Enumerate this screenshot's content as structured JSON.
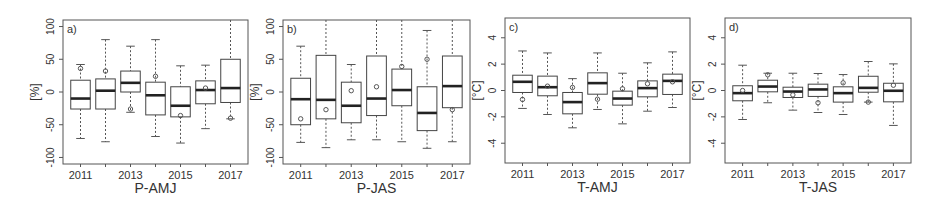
{
  "chart_data": [
    {
      "type": "box",
      "panel": "a)",
      "title": "",
      "xlabel": "P-AMJ",
      "ylabel": "[%]",
      "ylim": [
        -110,
        110
      ],
      "yticks": [
        100,
        50,
        0,
        -50,
        -100
      ],
      "xtick_labels": [
        "2011",
        "2013",
        "2015",
        "2017"
      ],
      "categories": [
        "2011",
        "2012",
        "2013",
        "2014",
        "2015",
        "2016",
        "2017"
      ],
      "grid": false,
      "boxes": [
        {
          "year": "2011",
          "whisker_low": -71,
          "q1": -26,
          "median": -10,
          "q3": 18,
          "whisker_high": 42,
          "mean": 36
        },
        {
          "year": "2012",
          "whisker_low": -76,
          "q1": -26,
          "median": 2,
          "q3": 20,
          "whisker_high": 80,
          "mean": 32
        },
        {
          "year": "2013",
          "whisker_low": -31,
          "q1": 0,
          "median": 14,
          "q3": 32,
          "whisker_high": 70,
          "mean": -26
        },
        {
          "year": "2014",
          "whisker_low": -68,
          "q1": -35,
          "median": -5,
          "q3": 15,
          "whisker_high": 80,
          "mean": 24
        },
        {
          "year": "2015",
          "whisker_low": -78,
          "q1": -38,
          "median": -21,
          "q3": 8,
          "whisker_high": 40,
          "mean": -36
        },
        {
          "year": "2016",
          "whisker_low": -56,
          "q1": -18,
          "median": 3,
          "q3": 17,
          "whisker_high": 41,
          "mean": 6
        },
        {
          "year": "2017",
          "whisker_low": -41,
          "q1": -16,
          "median": 6,
          "q3": 50,
          "whisker_high": 110,
          "mean": -40
        }
      ]
    },
    {
      "type": "box",
      "panel": "b)",
      "title": "",
      "xlabel": "P-JAS",
      "ylabel": "[%]",
      "ylim": [
        -110,
        110
      ],
      "yticks": [
        100,
        50,
        0,
        -50,
        -100
      ],
      "xtick_labels": [
        "2011",
        "2013",
        "2015",
        "2017"
      ],
      "categories": [
        "2011",
        "2012",
        "2013",
        "2014",
        "2015",
        "2016",
        "2017"
      ],
      "grid": false,
      "boxes": [
        {
          "year": "2011",
          "whisker_low": -77,
          "q1": -50,
          "median": -11,
          "q3": 21,
          "whisker_high": 70,
          "mean": -41
        },
        {
          "year": "2012",
          "whisker_low": -85,
          "q1": -41,
          "median": -12,
          "q3": 56,
          "whisker_high": 110,
          "mean": -27
        },
        {
          "year": "2013",
          "whisker_low": -73,
          "q1": -47,
          "median": -21,
          "q3": 15,
          "whisker_high": 42,
          "mean": 2
        },
        {
          "year": "2014",
          "whisker_low": -73,
          "q1": -36,
          "median": -10,
          "q3": 55,
          "whisker_high": 110,
          "mean": 8
        },
        {
          "year": "2015",
          "whisker_low": -76,
          "q1": -21,
          "median": 3,
          "q3": 35,
          "whisker_high": 110,
          "mean": 39
        },
        {
          "year": "2016",
          "whisker_low": -86,
          "q1": -59,
          "median": -32,
          "q3": 8,
          "whisker_high": 94,
          "mean": 50
        },
        {
          "year": "2017",
          "whisker_low": -76,
          "q1": -24,
          "median": 9,
          "q3": 55,
          "whisker_high": 110,
          "mean": -27
        }
      ]
    },
    {
      "type": "box",
      "panel": "c)",
      "title": "",
      "xlabel": "T-AMJ",
      "ylabel": "[°C]",
      "ylim": [
        -5.5,
        5.5
      ],
      "yticks": [
        4,
        2,
        0,
        -2,
        -4
      ],
      "xtick_labels": [
        "2011",
        "2013",
        "2015",
        "2017"
      ],
      "categories": [
        "2011",
        "2012",
        "2013",
        "2014",
        "2015",
        "2016",
        "2017"
      ],
      "grid": false,
      "boxes": [
        {
          "year": "2011",
          "whisker_low": -1.36,
          "q1": -0.15,
          "median": 0.66,
          "q3": 1.16,
          "whisker_high": 3.0,
          "mean": -0.68
        },
        {
          "year": "2012",
          "whisker_low": -1.82,
          "q1": -0.4,
          "median": 0.25,
          "q3": 1.09,
          "whisker_high": 2.85,
          "mean": 0.33
        },
        {
          "year": "2013",
          "whisker_low": -2.83,
          "q1": -1.77,
          "median": -0.88,
          "q3": -0.15,
          "whisker_high": 0.9,
          "mean": 0.23
        },
        {
          "year": "2014",
          "whisker_low": -1.44,
          "q1": -0.28,
          "median": 0.56,
          "q3": 1.34,
          "whisker_high": 2.85,
          "mean": -0.66
        },
        {
          "year": "2015",
          "whisker_low": -2.53,
          "q1": -1.11,
          "median": -0.61,
          "q3": -0.05,
          "whisker_high": 1.31,
          "mean": 0.13
        },
        {
          "year": "2016",
          "whisker_low": -1.57,
          "q1": -0.48,
          "median": 0.18,
          "q3": 0.73,
          "whisker_high": 2.1,
          "mean": 0.51
        },
        {
          "year": "2017",
          "whisker_low": -1.29,
          "q1": -0.3,
          "median": 0.73,
          "q3": 1.24,
          "whisker_high": 2.93,
          "mean": 0.66
        }
      ]
    },
    {
      "type": "box",
      "panel": "d)",
      "title": "",
      "xlabel": "T-JAS",
      "ylabel": "[°C]",
      "ylim": [
        -5.5,
        5.5
      ],
      "yticks": [
        4,
        2,
        0,
        -2,
        -4
      ],
      "xtick_labels": [
        "2011",
        "2013",
        "2015",
        "2017"
      ],
      "categories": [
        "2011",
        "2012",
        "2013",
        "2014",
        "2015",
        "2016",
        "2017"
      ],
      "grid": false,
      "boxes": [
        {
          "year": "2011",
          "whisker_low": -2.2,
          "q1": -0.78,
          "median": -0.2,
          "q3": 0.36,
          "whisker_high": 1.92,
          "mean": 0.0
        },
        {
          "year": "2012",
          "whisker_low": -0.93,
          "q1": -0.1,
          "median": 0.3,
          "q3": 0.78,
          "whisker_high": 1.31,
          "mean": 1.19
        },
        {
          "year": "2013",
          "whisker_low": -1.49,
          "q1": -0.53,
          "median": -0.08,
          "q3": 0.25,
          "whisker_high": 1.31,
          "mean": -0.33
        },
        {
          "year": "2014",
          "whisker_low": -1.67,
          "q1": -0.45,
          "median": 0.08,
          "q3": 0.48,
          "whisker_high": 1.29,
          "mean": -0.93
        },
        {
          "year": "2015",
          "whisker_low": -1.82,
          "q1": -0.88,
          "median": -0.2,
          "q3": 0.28,
          "whisker_high": 1.21,
          "mean": 0.58
        },
        {
          "year": "2016",
          "whisker_low": -0.88,
          "q1": -0.13,
          "median": 0.2,
          "q3": 1.08,
          "whisker_high": 2.2,
          "mean": -0.88
        },
        {
          "year": "2017",
          "whisker_low": -2.65,
          "q1": -0.86,
          "median": -0.02,
          "q3": 0.55,
          "whisker_high": 2.02,
          "mean": 0.4
        }
      ]
    }
  ],
  "layout": {
    "panels": [
      {
        "x0": 63,
        "x1": 248,
        "y0": 20,
        "y1": 164
      },
      {
        "x0": 283,
        "x1": 470,
        "y0": 20,
        "y1": 164
      },
      {
        "x0": 505,
        "x1": 690,
        "y0": 18,
        "y1": 163
      },
      {
        "x0": 725,
        "x1": 911,
        "y0": 18,
        "y1": 163
      }
    ]
  }
}
